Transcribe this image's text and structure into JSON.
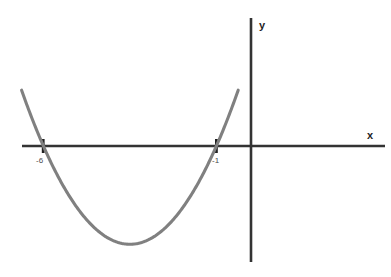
{
  "chart_data": {
    "type": "line",
    "title": "",
    "subtitle": "",
    "xlabel": "x",
    "ylabel": "y",
    "grid": false,
    "legend": null,
    "legend_position": "none",
    "xlim": [
      -6.7,
      3.9
    ],
    "ylim": [
      -3.2,
      2.3
    ],
    "curve_color": "#808080",
    "axis_color": "#333333",
    "label_color": "#4a4a4a",
    "series": [
      {
        "name": "parabola",
        "kind": "quadratic",
        "roots": [
          -6,
          -1
        ],
        "vertex": {
          "x": -3.5,
          "y": -2.84
        },
        "leading_coefficient": 0.4545,
        "x": [
          -6.63,
          -6.25,
          -5.75,
          -5.25,
          -4.75,
          -4.25,
          -3.75,
          -3.5,
          -3.25,
          -2.75,
          -2.25,
          -1.75,
          -1.25,
          -0.75,
          -0.37
        ],
        "y": [
          1.97,
          1.49,
          0.48,
          -0.36,
          -1.03,
          -1.52,
          -1.83,
          -1.89,
          -1.83,
          -1.52,
          -1.03,
          -0.36,
          0.48,
          1.49,
          2.05
        ]
      }
    ],
    "x_ticks": [
      {
        "value": -6,
        "label": "-6"
      },
      {
        "value": -1,
        "label": "-1"
      }
    ],
    "y_ticks": [],
    "annotations": []
  },
  "axes": {
    "x_axis_name": "x",
    "y_axis_name": "y"
  },
  "labels": {
    "root_left": "-6",
    "root_right": "-1",
    "axis_x": "x",
    "axis_y": "y"
  }
}
